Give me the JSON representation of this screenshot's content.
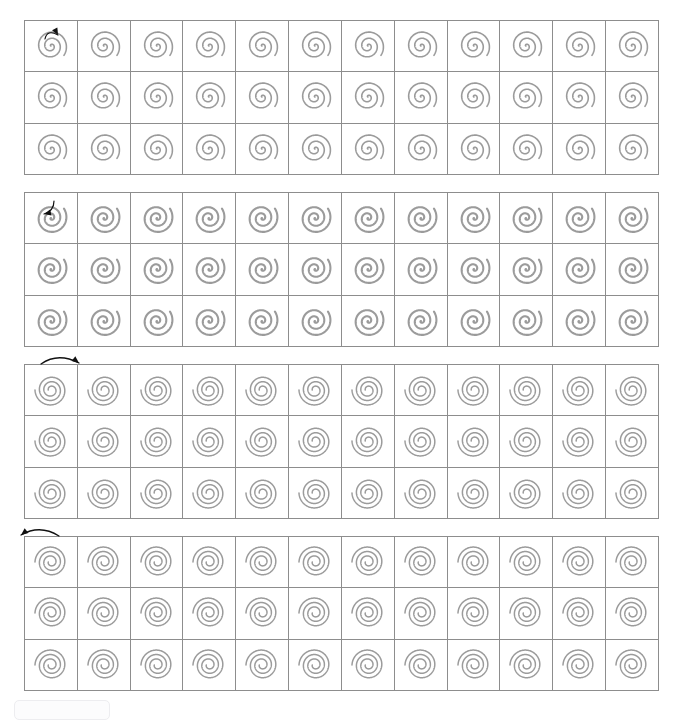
{
  "page": {
    "title_line": "",
    "background": "#ffffff",
    "width": 679,
    "height": 716
  },
  "style": {
    "grid_line_color": "#8d8d8d",
    "spiral_stroke_color": "#9b9b9b",
    "arrow_color": "#111111",
    "cell_width_px": 53,
    "cell_height_px": 52,
    "columns": 12,
    "rows": 3
  },
  "blocks": [
    {
      "id": "block-1",
      "name": "spiral-block-1",
      "top_px": 20,
      "spiral_type": "archimedean-open",
      "turns": 2.6,
      "stroke_width": 1.6,
      "rotation_deg": 0,
      "direction": "clockwise",
      "arrow": {
        "name": "rotation-direction-arrow-clockwise-inset",
        "placement": "inside-first-cell",
        "left_px": 18,
        "top_px": 6,
        "glyph": "curved-arrow-clockwise"
      },
      "cell_count": 36
    },
    {
      "id": "block-2",
      "name": "spiral-block-2",
      "top_px": 192,
      "spiral_type": "archimedean-open",
      "turns": 2.6,
      "stroke_width": 2.1,
      "rotation_deg": 0,
      "direction": "counter-clockwise",
      "arrow": {
        "name": "rotation-direction-arrow-counter-clockwise-inset",
        "placement": "inside-first-cell",
        "left_px": 13,
        "top_px": 5,
        "glyph": "curved-arrow-counter-clockwise"
      },
      "cell_count": 36
    },
    {
      "id": "block-3",
      "name": "spiral-block-3",
      "top_px": 364,
      "spiral_type": "concentric-rings",
      "turns": 3.0,
      "stroke_width": 1.5,
      "rotation_deg": 0,
      "direction": "clockwise",
      "arrow": {
        "name": "rotation-direction-arrow-clockwise-above",
        "placement": "above-first-cell",
        "left_px": 14,
        "top_px": -12,
        "glyph": "curved-arrow-clockwise-wide"
      },
      "cell_count": 36
    },
    {
      "id": "block-4",
      "name": "spiral-block-4",
      "top_px": 536,
      "spiral_type": "concentric-rings",
      "turns": 3.0,
      "stroke_width": 1.5,
      "rotation_deg": 0,
      "direction": "counter-clockwise",
      "arrow": {
        "name": "rotation-direction-arrow-counter-clockwise-above",
        "placement": "above-first-cell",
        "left_px": -8,
        "top_px": -12,
        "glyph": "curved-arrow-counter-clockwise-wide"
      },
      "cell_count": 36
    }
  ],
  "bottom_control": {
    "name": "page-footer-control",
    "label": "",
    "visible": true
  }
}
